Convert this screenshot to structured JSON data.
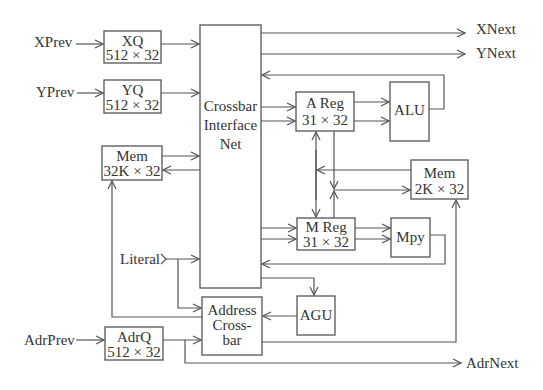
{
  "diagram": {
    "type": "block-diagram",
    "background": "#ffffff",
    "line_color": "#555555",
    "text_color": "#333333",
    "blocks": {
      "xq": {
        "line1": "XQ",
        "line2": "512 × 32"
      },
      "yq": {
        "line1": "YQ",
        "line2": "512 × 32"
      },
      "mem32k": {
        "line1": "Mem",
        "line2": "32K × 32"
      },
      "crossbar": {
        "line1": "Crossbar",
        "line2": "Interface",
        "line3": "Net"
      },
      "areg": {
        "line1": "A Reg",
        "line2": "31 × 32"
      },
      "alu": {
        "line1": "ALU"
      },
      "mem2k": {
        "line1": "Mem",
        "line2": "2K × 32"
      },
      "mreg": {
        "line1": "M Reg",
        "line2": "31 × 32"
      },
      "mpy": {
        "line1": "Mpy"
      },
      "agu": {
        "line1": "AGU"
      },
      "addrxbar": {
        "line1": "Address",
        "line2": "Cross-",
        "line3": "bar"
      },
      "adrq": {
        "line1": "AdrQ",
        "line2": "512 × 32"
      }
    },
    "ports": {
      "xprev": "XPrev",
      "yprev": "YPrev",
      "adrprev": "AdrPrev",
      "literal": "Literal",
      "xnext": "XNext",
      "ynext": "YNext",
      "adrnext": "AdrNext"
    }
  }
}
